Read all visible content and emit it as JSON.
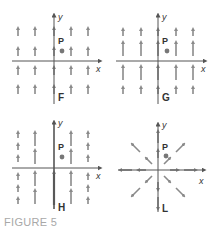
{
  "figure": {
    "caption": "FIGURE 5",
    "colors": {
      "axis": "#666666",
      "arrow": "#8a8a8a",
      "point": "#777777",
      "label": "#333333",
      "caption": "#a8a8a8"
    },
    "panels": [
      {
        "id": "F",
        "label": "F",
        "point_label": "P",
        "x_axis_label": "x",
        "y_axis_label": "y",
        "description": "Constant vertical field: all arrows equal length pointing up"
      },
      {
        "id": "G",
        "label": "G",
        "point_label": "P",
        "x_axis_label": "x",
        "y_axis_label": "y",
        "description": "Vertical field; magnitude larger near x-axis, smaller far from it"
      },
      {
        "id": "H",
        "label": "H",
        "point_label": "P",
        "x_axis_label": "x",
        "y_axis_label": "y",
        "description": "Vertical field; magnitude largest along y-axis, decreasing with |x|"
      },
      {
        "id": "L",
        "label": "L",
        "point_label": "P",
        "x_axis_label": "x",
        "y_axis_label": "y",
        "description": "Radial field pointing outward from the origin"
      }
    ]
  }
}
